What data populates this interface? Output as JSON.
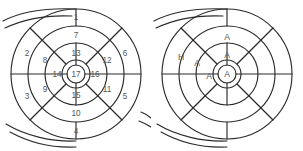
{
  "figure": {
    "background_color": "#ffffff",
    "stroke_color": "#2b2b2b",
    "label_color": "#555555",
    "diagrams": [
      {
        "id": "left",
        "name": "numbered-ring-diagram",
        "center_x": 76,
        "center_y": 74,
        "radii": [
          14,
          31,
          48,
          65
        ],
        "inner_circle_radius": 9,
        "labels": [
          {
            "text": "1",
            "x": 76,
            "y": 17,
            "cell": "outer-top"
          },
          {
            "text": "2",
            "x": 27,
            "y": 53,
            "cell": "outer-upper-left"
          },
          {
            "text": "3",
            "x": 27,
            "y": 96,
            "cell": "outer-lower-left"
          },
          {
            "text": "4",
            "x": 76,
            "y": 131,
            "cell": "outer-bottom"
          },
          {
            "text": "5",
            "x": 125,
            "y": 96,
            "cell": "outer-lower-right"
          },
          {
            "text": "6",
            "x": 125,
            "y": 53,
            "cell": "outer-upper-right"
          },
          {
            "text": "7",
            "x": 76,
            "y": 35,
            "cell": "middle-top"
          },
          {
            "text": "8",
            "x": 45,
            "y": 60,
            "cell": "middle-upper-left"
          },
          {
            "text": "9",
            "x": 45,
            "y": 89,
            "cell": "middle-lower-left"
          },
          {
            "text": "10",
            "x": 76,
            "y": 113,
            "cell": "middle-bottom"
          },
          {
            "text": "11",
            "x": 107,
            "y": 89,
            "cell": "middle-lower-right"
          },
          {
            "text": "12",
            "x": 107,
            "y": 60,
            "cell": "middle-upper-right"
          },
          {
            "text": "13",
            "x": 76,
            "y": 53,
            "cell": "inner-top"
          },
          {
            "text": "14",
            "x": 57,
            "y": 74,
            "cell": "inner-left"
          },
          {
            "text": "15",
            "x": 76,
            "y": 95,
            "cell": "inner-bottom"
          },
          {
            "text": "16",
            "x": 95,
            "y": 74,
            "cell": "inner-right"
          },
          {
            "text": "17",
            "x": 76,
            "y": 74,
            "cell": "core"
          }
        ]
      },
      {
        "id": "right",
        "name": "lettered-ring-diagram",
        "center_x": 76,
        "center_y": 74,
        "radii": [
          14,
          31,
          48,
          65
        ],
        "inner_circle_radius": 9,
        "labels": [
          {
            "text": "H",
            "x": 30,
            "y": 57,
            "cell": "outer-upper-left"
          },
          {
            "text": "A",
            "x": 76,
            "y": 37,
            "cell": "middle-top"
          },
          {
            "text": "A",
            "x": 46,
            "y": 63,
            "cell": "middle-upper-left"
          },
          {
            "text": "A",
            "x": 76,
            "y": 55,
            "cell": "inner-top"
          },
          {
            "text": "A",
            "x": 58,
            "y": 76,
            "cell": "inner-left"
          },
          {
            "text": "A",
            "x": 76,
            "y": 74,
            "cell": "core"
          }
        ]
      }
    ]
  }
}
